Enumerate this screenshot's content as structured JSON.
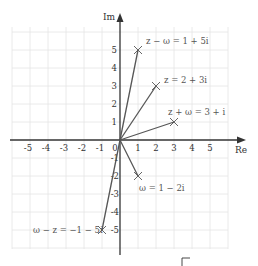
{
  "diagram": {
    "origin_px": [
      120,
      140
    ],
    "unit_px": 18,
    "grid": {
      "xmin": -6,
      "xmax": 6,
      "ymin": -6,
      "ymax": 6
    },
    "axes": {
      "x_label": "Re",
      "y_label": "Im",
      "x_ticks": [
        "-5",
        "-4",
        "-3",
        "-2",
        "-1",
        "0",
        "1",
        "2",
        "3",
        "4",
        "5"
      ],
      "y_ticks_pos": [
        "1",
        "2",
        "3",
        "4",
        "5"
      ],
      "y_ticks_neg": [
        "-1",
        "-2",
        "-3",
        "-4",
        "-5"
      ]
    },
    "points": [
      {
        "id": "z_minus_w",
        "re": 1,
        "im": 5,
        "label": "z − ω = 1 + 5i"
      },
      {
        "id": "z",
        "re": 2,
        "im": 3,
        "label": "z = 2 + 3i"
      },
      {
        "id": "z_plus_w",
        "re": 3,
        "im": 1,
        "label": "z + ω = 3 + i"
      },
      {
        "id": "w",
        "re": 1,
        "im": -2,
        "label": "ω = 1 − 2i"
      },
      {
        "id": "w_minus_z",
        "re": -1,
        "im": -5,
        "label": "ω − z = −1 − 5i"
      }
    ],
    "colors": {
      "grid": "#e4e4e4",
      "axis": "#333333",
      "vector": "#555555",
      "marker": "#555555"
    }
  }
}
